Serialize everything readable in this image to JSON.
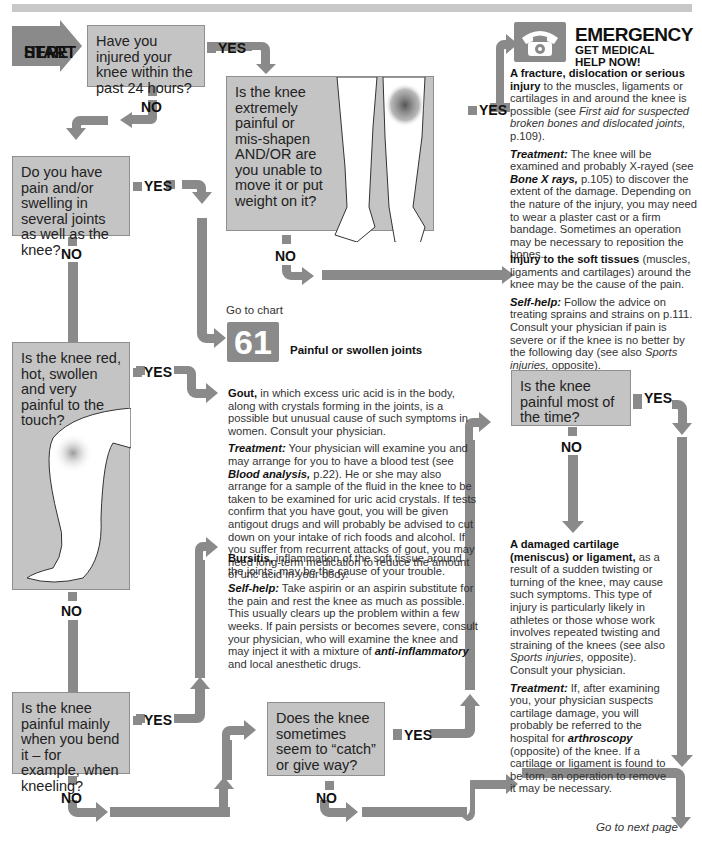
{
  "start": {
    "line1": "START",
    "line2": "HERE"
  },
  "labels": {
    "yes": "YES",
    "no": "NO"
  },
  "questions": {
    "q1": "Have you injured your knee within the past 24 hours?",
    "q2": "Is the knee extremely painful or mis-shapen AND/OR are you unable to move it or put weight on it?",
    "q3": "Do you have pain and/or swelling in several joints as well as the knee?",
    "q4": "Is the knee red, hot, swollen and very painful to the touch?",
    "q5": "Is the knee painful mainly when you bend it – for example, when kneeling?",
    "q6": "Does the knee sometimes seem to “catch” or give way?",
    "q7": "Is the knee painful most of the time?"
  },
  "emergency": {
    "icon": "telephone-icon",
    "title": "EMERGENCY",
    "subtitle_line1": "GET MEDICAL",
    "subtitle_line2": "HELP NOW!"
  },
  "outcomes": {
    "fracture": {
      "heading": "A fracture, dislocation or serious injury",
      "body": " to the muscles, ligaments or cartilages in and around the knee is possible (see ",
      "ref": "First aid for suspected broken bones and dislocated joints,",
      "tail": " p.109).",
      "treatment_label": "Treatment:",
      "treatment_a": " The knee will be examined and probably X-rayed (see ",
      "treatment_ref": "Bone X rays,",
      "treatment_b": " p.105) to discover the extent of the damage. Depending on the nature of the injury, you may need to wear a plaster cast or a firm bandage. Sometimes an operation may be necessary to reposition the bones."
    },
    "soft_tissue": {
      "heading": "Injury to the soft tissues",
      "body": " (muscles, ligaments and cartilages) around the knee may be the cause of the pain.",
      "selfhelp_label": "Self-help:",
      "selfhelp_a": " Follow the advice on treating sprains and strains on p.111. Consult your physician if pain is severe or if the knee is no better by the following day (see also ",
      "selfhelp_ref": "Sports injuries,",
      "selfhelp_b": " opposite)."
    },
    "chart_ref": {
      "goto": "Go to chart",
      "number": "61",
      "title": "Painful or swollen joints"
    },
    "gout": {
      "heading": "Gout,",
      "body": " in which excess uric acid is in the body, along with crystals forming in the joints, is a possible but unusual cause of such symptoms in women. Consult your physician.",
      "treatment_label": "Treatment:",
      "treatment_a": " Your physician will examine you and may arrange for you to have a blood test (see ",
      "treatment_ref": "Blood analysis,",
      "treatment_b": " p.22). He or she may also arrange for a sample of the fluid in the knee to be taken to be examined for uric acid crystals. If tests confirm that you have gout, you will be given antigout drugs and will probably be advised to cut down on your intake of rich foods and alcohol. If you suffer from recurrent attacks of gout, you may need long-term medication to reduce the amount of uric acid in your body."
    },
    "bursitis": {
      "heading": "Bursitis,",
      "body": " inflammation of the soft tissue around the joints, may be the cause of your trouble.",
      "selfhelp_label": "Self-help:",
      "selfhelp_a": " Take aspirin or an aspirin substitute for the pain and rest the knee as much as possible. This usually clears up the problem within a few weeks. If pain persists or becomes severe, consult your physician, who will examine the knee and may inject it with a mixture of ",
      "selfhelp_ref": "anti-inflammatory",
      "selfhelp_b": " and local anesthetic drugs."
    },
    "cartilage": {
      "heading": "A damaged cartilage (meniscus) or ligament,",
      "body": " as a result of a sudden twisting or turning of the knee, may cause such symptoms. This type of injury is particularly likely in athletes or those whose work involves repeated twisting and straining of the knees (see also ",
      "ref": "Sports injuries,",
      "tail": " opposite). Consult your physician.",
      "treatment_label": "Treatment:",
      "treatment_a": " If, after examining you, your physician suspects cartilage damage, you will probably be referred to the hospital for ",
      "treatment_ref": "arthroscopy",
      "treatment_b": " (opposite) of the knee. If a cartilage or ligament is found to be torn, an operation to remove it may be necessary."
    }
  },
  "footer": {
    "next": "Go to next page"
  },
  "colors": {
    "box": "#c4c4c4",
    "arrow": "#8a8a8a",
    "topbar": "#c8c8c8"
  }
}
